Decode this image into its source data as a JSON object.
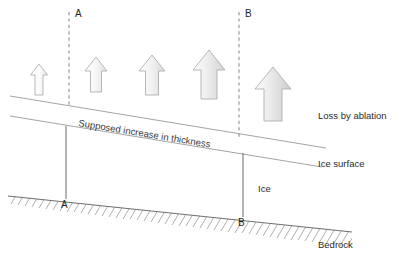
{
  "figure": {
    "width": 400,
    "height": 265,
    "background_color": "#ffffff"
  },
  "labels": {
    "top_marker_a": "A",
    "top_marker_b": "B",
    "bottom_marker_a": "A",
    "bottom_marker_b": "B",
    "loss_by_ablation": "Loss by ablation",
    "supposed_increase": "Supposed increase in thickness",
    "ice_surface": "Ice surface",
    "ice": "Ice",
    "bedrock": "Bedrock"
  },
  "colors": {
    "line": "#9a9a9a",
    "bedrock_line": "#6f6f6f",
    "hatch": "#8d8d8d",
    "dashed": "#8c8c8c",
    "text": "#2b2b2b",
    "arrow_stroke": "#a6a6a6",
    "arrow_fill_light": "#fcfcfc",
    "arrow_fill_dark": "#d9d9d9"
  },
  "geometry": {
    "supposed_surface_line": {
      "x1": 10,
      "y1": 96,
      "x2": 326,
      "y2": 148
    },
    "ice_surface_line": {
      "x1": 10,
      "y1": 116,
      "x2": 322,
      "y2": 167
    },
    "bedrock_line": {
      "x1": 8,
      "y1": 196,
      "x2": 352,
      "y2": 232
    },
    "dashed_a": {
      "x": 69,
      "y1": 12,
      "y2": 106
    },
    "dashed_b": {
      "x": 239,
      "y1": 12,
      "y2": 140
    },
    "vertical_a": {
      "x": 66,
      "y1": 126,
      "y2": 199
    },
    "vertical_b": {
      "x": 243,
      "y1": 153,
      "y2": 217
    }
  },
  "arrows": [
    {
      "name": "ablation-arrow-1",
      "cx": 39,
      "base_y": 95,
      "width": 11,
      "height": 28,
      "fill": "#fcfcfc"
    },
    {
      "name": "ablation-arrow-2",
      "cx": 96,
      "base_y": 92,
      "width": 15,
      "height": 35,
      "fill": "#f2f2f2"
    },
    {
      "name": "ablation-arrow-3",
      "cx": 152,
      "base_y": 95,
      "width": 18,
      "height": 40,
      "fill": "#eeeeee"
    },
    {
      "name": "ablation-arrow-4",
      "cx": 209,
      "base_y": 99,
      "width": 22,
      "height": 49,
      "fill": "#e4e4e4"
    },
    {
      "name": "ablation-arrow-5",
      "cx": 273,
      "base_y": 121,
      "width": 25,
      "height": 54,
      "fill": "#dcdcdc"
    }
  ],
  "legend_notes": {
    "slope_text_rotation_deg": 9.3,
    "hatch_count": 46,
    "hatch_angle_deg": 60
  }
}
